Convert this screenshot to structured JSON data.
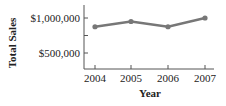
{
  "chart_data": {
    "type": "line",
    "title": "",
    "xlabel": "Year",
    "ylabel": "Total Sales",
    "categories": [
      "2004",
      "2005",
      "2006",
      "2007"
    ],
    "series": [
      {
        "name": "Total Sales",
        "values": [
          875000,
          950000,
          875000,
          1000000
        ]
      }
    ],
    "y_ticks": [
      500000,
      750000,
      1000000
    ],
    "y_tick_labels": [
      "$500,000",
      "",
      "$1,000,000"
    ],
    "ylim": [
      350000,
      1100000
    ],
    "grid": false,
    "legend": "none",
    "colors": {
      "line": "#777777",
      "axis": "#555555",
      "text": "#222222"
    }
  }
}
